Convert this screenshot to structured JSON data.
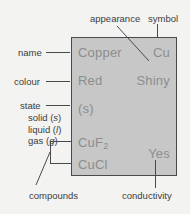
{
  "card": {
    "name": "Copper",
    "symbol": "Cu",
    "colour": "Red",
    "appearance": "Shiny",
    "state_value": "(s)",
    "compound_1_base": "CuF",
    "compound_1_sub": "2",
    "compound_2": "CuCl",
    "conductivity_value": "Yes",
    "fill_color": "#c7c7c7",
    "border_color": "#4a4a4a",
    "text_color": "#8d8d8d"
  },
  "labels": {
    "name": "name",
    "colour": "colour",
    "state": "state",
    "appearance": "appearance",
    "symbol": "symbol",
    "compounds": "compounds",
    "conductivity": "conductivity"
  },
  "state_key": {
    "solid_text": "solid (",
    "solid_sym": "s",
    "solid_close": ")",
    "liquid_text": "liquid (",
    "liquid_sym": "l",
    "liquid_close": ")",
    "gas_text": "gas (",
    "gas_sym": "g",
    "gas_close": ")"
  },
  "page": {
    "background": "#f3f3f2",
    "label_color": "#3c3c3c"
  }
}
